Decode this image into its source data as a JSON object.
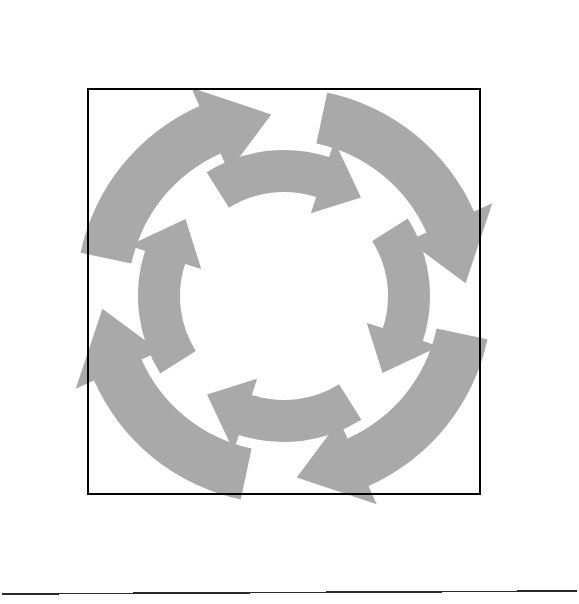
{
  "page": {
    "width": 579,
    "height": 604,
    "background_color": "#ffffff"
  },
  "colors": {
    "arrow_fill": "#a9a9a9",
    "frame_stroke": "#000000",
    "rule_stroke": "#2b2b2b",
    "background": "#ffffff"
  },
  "diagram": {
    "type": "cycle",
    "center": {
      "x": 284,
      "y": 296
    },
    "ring_count": 2,
    "rings": [
      {
        "name": "outer-ring",
        "direction": "clockwise",
        "arrow_count": 4,
        "radius_outer": 208,
        "radius_inner": 156,
        "arc_span_deg": 74,
        "start_angle_deg": -78,
        "step_deg": 90,
        "arrowheads": [
          "top",
          "right",
          "bottom",
          "left"
        ]
      },
      {
        "name": "inner-ring",
        "direction": "clockwise",
        "arrow_count": 4,
        "radius_outer": 146,
        "radius_inner": 104,
        "arc_span_deg": 70,
        "start_angle_deg": -122,
        "step_deg": 90,
        "arrowheads": [
          "top",
          "right",
          "bottom",
          "left"
        ]
      }
    ]
  },
  "frame": {
    "name": "bounding-rectangle",
    "x": 88,
    "y": 89,
    "width": 392,
    "height": 405,
    "stroke_width": 2
  },
  "footer_rule": {
    "name": "horizontal-separator",
    "x1": 2,
    "y1": 594,
    "x2": 577,
    "y2": 591,
    "stroke_width": 1.6
  },
  "labels": {
    "caption": "",
    "annotations": []
  },
  "chart_data": {
    "type": "pie",
    "title": "",
    "categories": [
      "outer-arrow-1",
      "outer-arrow-2",
      "outer-arrow-3",
      "outer-arrow-4",
      "inner-arrow-1",
      "inner-arrow-2",
      "inner-arrow-3",
      "inner-arrow-4"
    ],
    "values": [
      74,
      74,
      74,
      74,
      70,
      70,
      70,
      70
    ],
    "xlabel": "",
    "ylabel": "",
    "legend": []
  }
}
